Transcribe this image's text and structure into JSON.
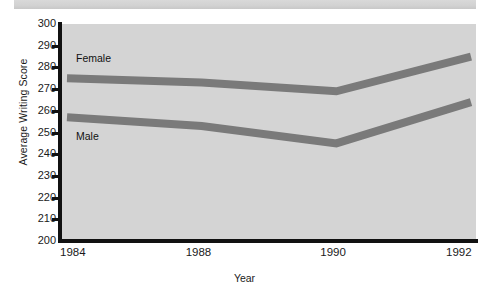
{
  "chart_data": {
    "type": "line",
    "title": "",
    "xlabel": "Year",
    "ylabel": "Average Writing Score",
    "x": [
      1984,
      1988,
      1990,
      1992
    ],
    "categories": [
      "1984",
      "1988",
      "1990",
      "1992"
    ],
    "series": [
      {
        "name": "Female",
        "values": [
          275,
          273,
          269,
          285
        ]
      },
      {
        "name": "Male",
        "values": [
          257,
          253,
          245,
          264
        ]
      }
    ],
    "ylim": [
      200,
      300
    ],
    "yticks": [
      300,
      290,
      280,
      270,
      260,
      250,
      240,
      230,
      220,
      210,
      200
    ],
    "ytick_labels": [
      "300",
      "290",
      "280",
      "270",
      "260",
      "250",
      "240",
      "230",
      "220",
      "210",
      "200"
    ],
    "xtick_labels": [
      "1984",
      "1988",
      "1990",
      "1992"
    ],
    "grid": false,
    "legend_position": "inline-annotations",
    "annotations": [
      {
        "text": "Female",
        "series": "Female"
      },
      {
        "text": "Male",
        "series": "Male"
      }
    ],
    "colors": {
      "line": "#7a7a7a",
      "plot_background": "#d4d4d4",
      "axis": "#111111",
      "text": "#1a1a1a",
      "page_background": "#ffffff",
      "top_strip": "#d4d4d4"
    }
  }
}
